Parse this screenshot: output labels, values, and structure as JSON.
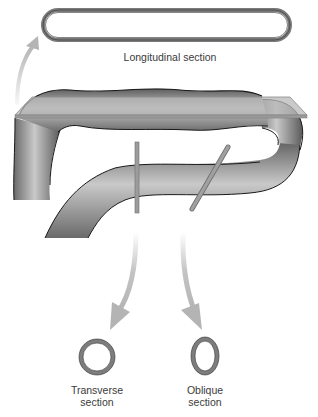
{
  "diagram": {
    "labels": {
      "longitudinal": "Longitudinal section",
      "transverse_line1": "Transverse",
      "transverse_line2": "section",
      "oblique_line1": "Oblique",
      "oblique_line2": "section"
    },
    "colors": {
      "tube_dark": "#5a5a5a",
      "tube_light": "#c8c8c8",
      "outline": "#1a1a1a",
      "plane": "#a8a8a8",
      "arrow": "#b4b4b4",
      "ring": "#7d7d7d"
    }
  }
}
